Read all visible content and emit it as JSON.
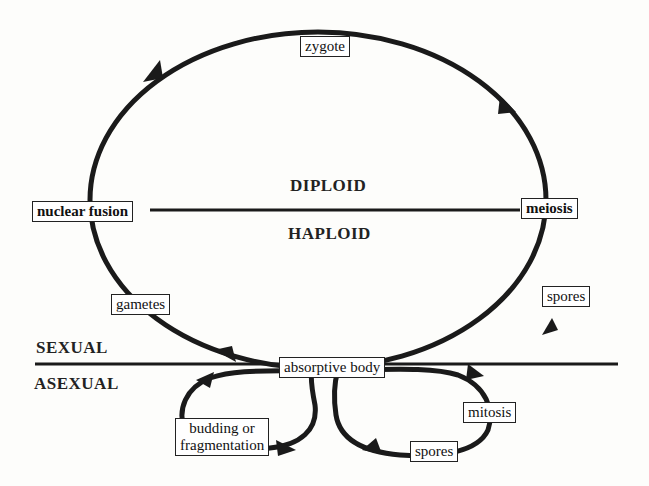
{
  "diagram": {
    "type": "life-cycle",
    "regions": {
      "diploid": "DIPLOID",
      "haploid": "HAPLOID",
      "sexual": "SEXUAL",
      "asexual": "ASEXUAL"
    },
    "nodes": {
      "zygote": "zygote",
      "nuclear_fusion": "nuclear fusion",
      "meiosis": "meiosis",
      "gametes": "gametes",
      "spores_sexual": "spores",
      "absorptive_body": "absorptive body",
      "budding_line1": "budding or",
      "budding_line2": "fragmentation",
      "mitosis": "mitosis",
      "spores_asexual": "spores"
    },
    "colors": {
      "stroke": "#1a1a1a",
      "background": "#fdfdfb"
    }
  }
}
